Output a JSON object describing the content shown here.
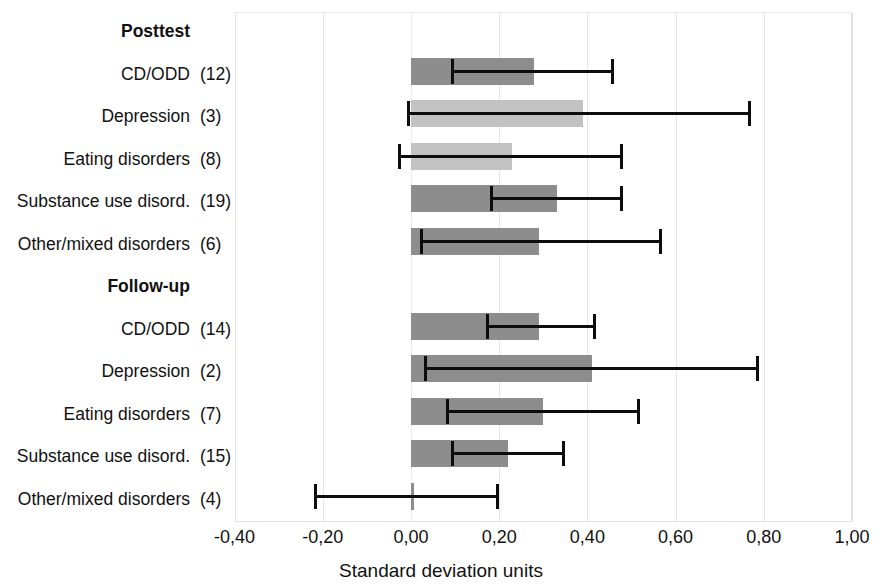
{
  "chart_data": {
    "type": "bar",
    "orientation": "horizontal",
    "title": "",
    "xlabel": "Standard deviation units",
    "ylabel": "",
    "xlim": [
      -0.4,
      1.0
    ],
    "xticks": [
      -0.4,
      -0.2,
      0.0,
      0.2,
      0.4,
      0.6,
      0.8,
      1.0
    ],
    "xticklabels": [
      "-0,40",
      "-0,20",
      "0,00",
      "0,20",
      "0,40",
      "0,60",
      "0,80",
      "1,00"
    ],
    "grid": true,
    "legend": "none",
    "decimal_separator": "comma",
    "sections": [
      "Posttest",
      "Follow-up"
    ],
    "error_bar_note": "95% confidence interval",
    "rows": [
      {
        "kind": "section",
        "label": "Posttest",
        "count": ""
      },
      {
        "kind": "data",
        "section": "Posttest",
        "label": "CD/ODD",
        "count": "(12)",
        "n": 12,
        "value": 0.28,
        "ci_low": 0.09,
        "ci_high": 0.46,
        "shade": "dark"
      },
      {
        "kind": "data",
        "section": "Posttest",
        "label": "Depression",
        "count": "(3)",
        "n": 3,
        "value": 0.39,
        "ci_low": -0.01,
        "ci_high": 0.77,
        "shade": "light"
      },
      {
        "kind": "data",
        "section": "Posttest",
        "label": "Eating disorders",
        "count": "(8)",
        "n": 8,
        "value": 0.23,
        "ci_low": -0.03,
        "ci_high": 0.48,
        "shade": "light"
      },
      {
        "kind": "data",
        "section": "Posttest",
        "label": "Substance use disord.",
        "count": "(19)",
        "n": 19,
        "value": 0.33,
        "ci_low": 0.18,
        "ci_high": 0.48,
        "shade": "dark"
      },
      {
        "kind": "data",
        "section": "Posttest",
        "label": "Other/mixed disorders",
        "count": "(6)",
        "n": 6,
        "value": 0.29,
        "ci_low": 0.02,
        "ci_high": 0.57,
        "shade": "dark"
      },
      {
        "kind": "section",
        "label": "Follow-up",
        "count": ""
      },
      {
        "kind": "data",
        "section": "Follow-up",
        "label": "CD/ODD",
        "count": "(14)",
        "n": 14,
        "value": 0.29,
        "ci_low": 0.17,
        "ci_high": 0.42,
        "shade": "dark"
      },
      {
        "kind": "data",
        "section": "Follow-up",
        "label": "Depression",
        "count": "(2)",
        "n": 2,
        "value": 0.41,
        "ci_low": 0.03,
        "ci_high": 0.79,
        "shade": "dark"
      },
      {
        "kind": "data",
        "section": "Follow-up",
        "label": "Eating disorders",
        "count": "(7)",
        "n": 7,
        "value": 0.3,
        "ci_low": 0.08,
        "ci_high": 0.52,
        "shade": "dark"
      },
      {
        "kind": "data",
        "section": "Follow-up",
        "label": "Substance use disord.",
        "count": "(15)",
        "n": 15,
        "value": 0.22,
        "ci_low": 0.09,
        "ci_high": 0.35,
        "shade": "dark"
      },
      {
        "kind": "data",
        "section": "Follow-up",
        "label": "Other/mixed disorders",
        "count": "(4)",
        "n": 4,
        "value": 0.0,
        "ci_low": -0.22,
        "ci_high": 0.2,
        "shade": "dark"
      }
    ]
  },
  "colors": {
    "bar_dark": "#8d8d8d",
    "bar_light": "#c2c2c2",
    "error_bar": "#0d0d0d",
    "gridline": "#e6e6e6",
    "background": "#ffffff",
    "text": "#111111"
  }
}
